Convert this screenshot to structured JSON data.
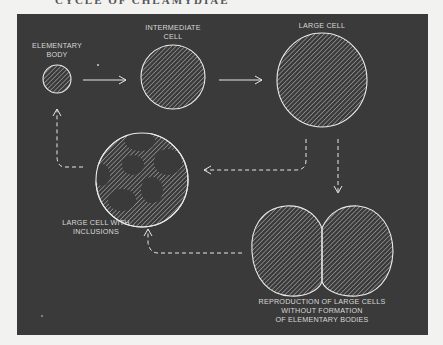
{
  "page": {
    "heading": "CYCLE OF CHLAMYDIAE"
  },
  "colors": {
    "panel_bg": "#3a3a3a",
    "page_bg": "#f2f2f0",
    "line": "#e6e6e6",
    "text": "#d8d8d8"
  },
  "diagram": {
    "nodes": {
      "elementary_body": {
        "lines": [
          "ELEMENTARY",
          "BODY"
        ]
      },
      "intermediate_cell": {
        "lines": [
          "INTERMEDIATE",
          "CELL"
        ]
      },
      "large_cell": {
        "lines": [
          "LARGE  CELL"
        ]
      },
      "large_cell_inclusions": {
        "lines": [
          "LARGE CELL WITH",
          "INCLUSIONS"
        ]
      },
      "reproduction": {
        "lines": [
          "REPRODUCTION OF LARGE CELLS",
          "WITHOUT FORMATION",
          "OF ELEMENTARY BODIES"
        ]
      }
    },
    "edges": [
      {
        "from": "elementary_body",
        "to": "intermediate_cell",
        "style": "solid"
      },
      {
        "from": "intermediate_cell",
        "to": "large_cell",
        "style": "solid"
      },
      {
        "from": "large_cell",
        "to": "large_cell_inclusions",
        "style": "dashed"
      },
      {
        "from": "large_cell",
        "to": "reproduction",
        "style": "dashed"
      },
      {
        "from": "large_cell_inclusions",
        "to": "elementary_body",
        "style": "dashed"
      },
      {
        "from": "reproduction",
        "to": "large_cell_inclusions",
        "style": "dashed"
      }
    ]
  }
}
